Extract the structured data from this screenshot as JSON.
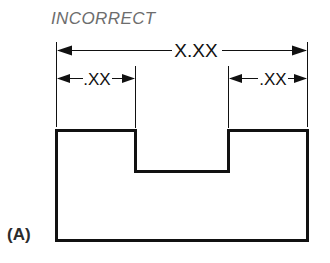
{
  "figure": {
    "caption_label": "(A)",
    "status_label": "INCORRECT",
    "status_color": "#6d6d6d",
    "line_color": "#111111",
    "background_color": "#ffffff",
    "dimensions": {
      "overall": {
        "value": "X.XX",
        "name": "overall-width-dimension"
      },
      "left_step": {
        "value": ".XX",
        "name": "left-step-dimension"
      },
      "right_step": {
        "value": ".XX",
        "name": "right-step-dimension"
      }
    },
    "geometry": {
      "outline_name": "notched-block-profile",
      "left_edge_x": 56,
      "right_edge_x": 308,
      "top_edge_y": 130,
      "bottom_edge_y": 241,
      "notch_left_x": 135,
      "notch_right_x": 228,
      "notch_bottom_y": 172
    }
  }
}
